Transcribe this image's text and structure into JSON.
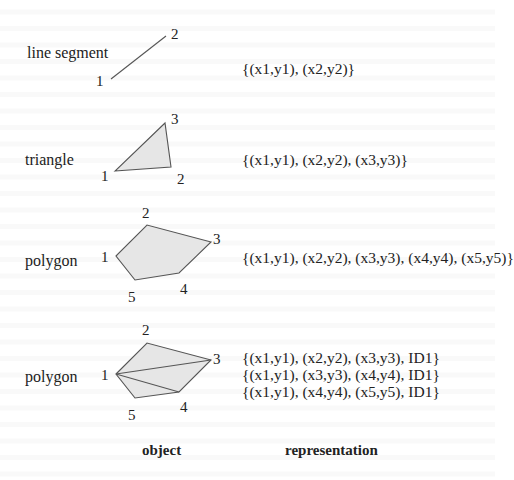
{
  "rows": [
    {
      "object_label": "line segment",
      "vertex_labels": [
        "1",
        "2"
      ],
      "representation": [
        "{(x1,y1), (x2,y2)}"
      ]
    },
    {
      "object_label": "triangle",
      "vertex_labels": [
        "1",
        "2",
        "3"
      ],
      "representation": [
        "{(x1,y1), (x2,y2), (x3,y3)}"
      ]
    },
    {
      "object_label": "polygon",
      "vertex_labels": [
        "1",
        "2",
        "3",
        "4",
        "5"
      ],
      "representation": [
        "{(x1,y1), (x2,y2), (x3,y3), (x4,y4), (x5,y5)}"
      ]
    },
    {
      "object_label": "polygon",
      "vertex_labels": [
        "1",
        "2",
        "3",
        "4",
        "5"
      ],
      "representation": [
        "{(x1,y1), (x2,y2), (x3,y3), ID1}",
        "{(x1,y1), (x3,y3), (x4,y4), ID1}",
        "{(x1,y1), (x4,y4), (x5,y5), ID1}"
      ]
    }
  ],
  "columns": {
    "object": "object",
    "representation": "representation"
  },
  "colors": {
    "fill": "#e6e6e6",
    "stroke": "#555555",
    "text": "#222222"
  }
}
